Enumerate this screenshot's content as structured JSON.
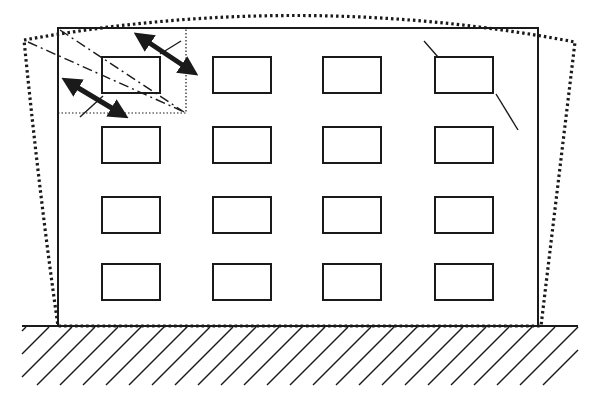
{
  "diagram": {
    "title": "",
    "colors": {
      "stroke": "#1a1a1a",
      "background": "#ffffff"
    },
    "building": {
      "x": 58,
      "y": 28,
      "width": 480,
      "height": 298
    },
    "deformed_outline": "M 24 40 Q 300 -10 575 42 L 541 326 L 58 326 Q 40 200 24 40 Z",
    "ground": {
      "y": 326,
      "x1": 22,
      "x2": 578,
      "hatch_bottom": 385
    },
    "windows": {
      "cols": [
        102,
        213,
        323,
        435
      ],
      "rows": [
        57,
        127,
        197,
        264
      ],
      "width": 58,
      "height": 36
    },
    "detail_box": {
      "x": 58,
      "y": 28,
      "width": 128,
      "height": 85
    },
    "cracks": [
      {
        "type": "dash-dot",
        "points": "60,30 184,112"
      },
      {
        "type": "dash-dot",
        "points": "28,42 182,111"
      }
    ],
    "arrows": [
      {
        "x1": 142,
        "y1": 38,
        "x2": 190,
        "y2": 70
      },
      {
        "x1": 70,
        "y1": 83,
        "x2": 120,
        "y2": 113
      }
    ],
    "corner_cracks": [
      "160,54 181,41",
      "80,117 103,96",
      "424,41 438,57",
      "496,94 518,130"
    ]
  }
}
